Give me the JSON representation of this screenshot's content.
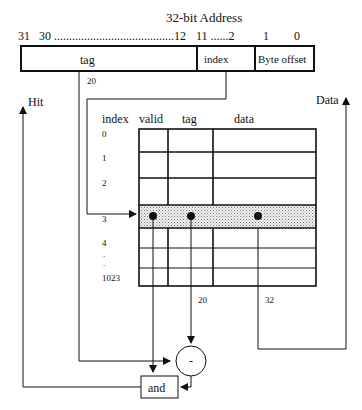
{
  "title": "32-bit  Address",
  "bit_labels": {
    "b31": "31",
    "b30_12": "30 ........................................12",
    "b11_2": "11 ......2",
    "b1": "1",
    "b0": "0"
  },
  "address_fields": {
    "tag": "tag",
    "index": "index",
    "byte_offset": "Byte offset"
  },
  "wire_labels": {
    "tag_width_top": "20",
    "tag_width_compare": "20",
    "data_width": "32"
  },
  "outputs": {
    "hit": "Hit",
    "data": "Data"
  },
  "table": {
    "headers": [
      "index",
      "valid",
      "tag",
      "data"
    ],
    "row_labels": [
      "0",
      "1",
      "2",
      "3",
      "4",
      ".",
      ".",
      "1023"
    ],
    "selected_row": "3"
  },
  "comparator": {
    "symbol": "-"
  },
  "and_gate": {
    "label": "and"
  }
}
